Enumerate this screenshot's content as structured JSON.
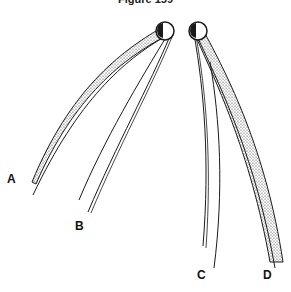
{
  "figure": {
    "title": "Figure 159",
    "labels": {
      "a": "A",
      "b": "B",
      "c": "C",
      "d": "D"
    }
  },
  "colors": {
    "ink": "#1a1a1a",
    "background": "#ffffff"
  }
}
